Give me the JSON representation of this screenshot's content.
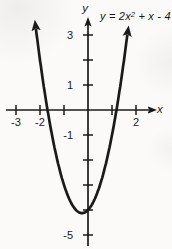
{
  "figure": {
    "equation": {
      "pre": "y = 2x",
      "sup": "2",
      "post": " + x - 4",
      "full": "y = 2x^2 + x - 4"
    },
    "x_axis_label": "x",
    "y_axis_label": "y"
  },
  "chart_data": {
    "type": "line",
    "function": "y = 2*x^2 + x - 4",
    "coefficients": [
      2,
      1,
      -4
    ],
    "xlabel": "x",
    "ylabel": "y",
    "xlim": [
      -3.4,
      2.8
    ],
    "ylim": [
      -5.6,
      3.8
    ],
    "grid": false,
    "line_color": "#1a1a1a",
    "x_ticks": [
      -3,
      -2,
      -1,
      1,
      2
    ],
    "y_ticks": [
      3,
      2,
      1,
      -1,
      -2,
      -3,
      -4,
      -5
    ],
    "x_tick_labels": [
      {
        "value": -3,
        "label": "-3"
      },
      {
        "value": -2,
        "label": "-2"
      },
      {
        "value": 2,
        "label": "2"
      }
    ],
    "y_tick_labels": [
      {
        "value": 3,
        "label": "3"
      },
      {
        "value": 1,
        "label": "1"
      },
      {
        "value": -1,
        "label": "-1"
      },
      {
        "value": -5,
        "label": "-5"
      }
    ],
    "key_points": {
      "roots": [
        -1.686,
        1.186
      ],
      "vertex": [
        -0.25,
        -4.125
      ],
      "y_intercept": [
        0,
        -4
      ]
    },
    "sample_points": [
      [
        -2,
        2
      ],
      [
        -1.5,
        -1
      ],
      [
        -1,
        -3
      ],
      [
        -0.5,
        -4
      ],
      [
        0,
        -4
      ],
      [
        0.5,
        -3
      ],
      [
        1,
        -1
      ],
      [
        1.5,
        2
      ]
    ],
    "x_draw_range": [
      -2.17,
      1.66
    ]
  }
}
